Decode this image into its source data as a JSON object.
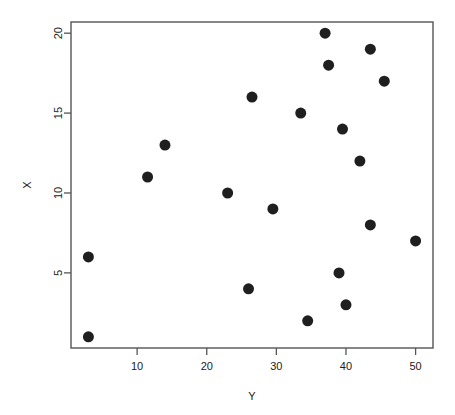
{
  "chart_data": {
    "type": "scatter",
    "title": "",
    "subtitle": "",
    "xlabel": "Y",
    "ylabel": "X",
    "xlim": [
      0.5,
      52.5
    ],
    "ylim": [
      0.3,
      20.7
    ],
    "xticks": [
      10,
      20,
      30,
      40,
      50
    ],
    "xtick_labels": [
      "10",
      "20",
      "30",
      "40",
      "50"
    ],
    "yticks": [
      5,
      10,
      15,
      20
    ],
    "ytick_labels": [
      "5",
      "10",
      "15",
      "20"
    ],
    "grid": false,
    "legend": null,
    "legend_position": "none",
    "marker": "filled-circle",
    "marker_color": "#1f1f1f",
    "marker_size_px": 11,
    "frame_color": "#555555",
    "background_color": "#ffffff",
    "n_points": 20,
    "x": [
      3,
      3,
      11.5,
      14,
      23,
      26,
      26.5,
      29.5,
      33.5,
      34.5,
      37,
      37.5,
      39,
      39.5,
      40,
      42,
      43.5,
      43.5,
      45.5,
      50
    ],
    "y": [
      1,
      6,
      11,
      13,
      10,
      4,
      16,
      9,
      15,
      2,
      20,
      18,
      5,
      14,
      3,
      12,
      8,
      19,
      17,
      7
    ],
    "points": [
      {
        "x": 3,
        "y": 1
      },
      {
        "x": 3,
        "y": 6
      },
      {
        "x": 11.5,
        "y": 11
      },
      {
        "x": 14,
        "y": 13
      },
      {
        "x": 23,
        "y": 10
      },
      {
        "x": 26,
        "y": 4
      },
      {
        "x": 26.5,
        "y": 16
      },
      {
        "x": 29.5,
        "y": 9
      },
      {
        "x": 33.5,
        "y": 15
      },
      {
        "x": 34.5,
        "y": 2
      },
      {
        "x": 37,
        "y": 20
      },
      {
        "x": 37.5,
        "y": 18
      },
      {
        "x": 39,
        "y": 5
      },
      {
        "x": 39.5,
        "y": 14
      },
      {
        "x": 40,
        "y": 3
      },
      {
        "x": 42,
        "y": 12
      },
      {
        "x": 43.5,
        "y": 8
      },
      {
        "x": 43.5,
        "y": 19
      },
      {
        "x": 45.5,
        "y": 17
      },
      {
        "x": 50,
        "y": 7
      }
    ]
  },
  "axis_titles": {
    "x": "Y",
    "y": "X"
  }
}
